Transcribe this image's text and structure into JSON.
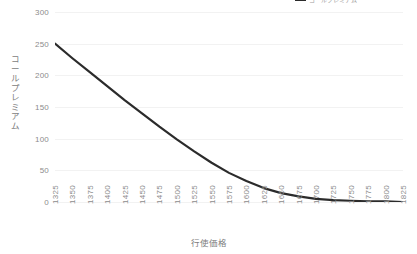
{
  "chart_data": {
    "type": "line",
    "title": "",
    "xlabel": "行使価格",
    "ylabel": "コールプレミアム",
    "legend": {
      "label": "コールプレミアム",
      "position": "top",
      "color": "#2b2b2b"
    },
    "grid": true,
    "xlim": [
      1325,
      1825
    ],
    "ylim": [
      0,
      300
    ],
    "yticks": [
      0,
      50,
      100,
      150,
      200,
      250,
      300
    ],
    "categories": [
      "1325",
      "1350",
      "1375",
      "1400",
      "1425",
      "1450",
      "1475",
      "1500",
      "1525",
      "1550",
      "1575",
      "1600",
      "1625",
      "1650",
      "1675",
      "1700",
      "1725",
      "1750",
      "1775",
      "1800",
      "1825"
    ],
    "x": [
      1325,
      1350,
      1375,
      1400,
      1425,
      1450,
      1475,
      1500,
      1525,
      1550,
      1575,
      1600,
      1625,
      1650,
      1675,
      1700,
      1725,
      1750,
      1775,
      1800,
      1825
    ],
    "series": [
      {
        "name": "コールプレミアム",
        "color": "#2b2b2b",
        "values": [
          250,
          227,
          205,
          183,
          161,
          140,
          119,
          99,
          80,
          62,
          46,
          33,
          22,
          14,
          9,
          5,
          3,
          2,
          1,
          1,
          0
        ]
      }
    ]
  },
  "axis": {
    "y_title": "コールプレミアム",
    "x_title": "行使価格",
    "y_labels": [
      "300",
      "250",
      "200",
      "150",
      "100",
      "50",
      "0"
    ],
    "x_labels": [
      "1325",
      "1350",
      "1375",
      "1400",
      "1425",
      "1450",
      "1475",
      "1500",
      "1525",
      "1550",
      "1575",
      "1600",
      "1625",
      "1650",
      "1675",
      "1700",
      "1725",
      "1750",
      "1775",
      "1800",
      "1825"
    ]
  },
  "legend": {
    "label": "コールプレミアム"
  },
  "colors": {
    "line": "#2b2b2b",
    "grid": "#f2f2f2",
    "tick_text": "#8c8c8c",
    "title_text": "#7d7d7d",
    "background": "#ffffff"
  }
}
